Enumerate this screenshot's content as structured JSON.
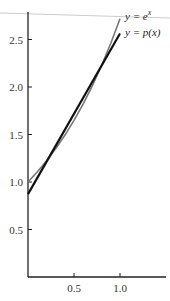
{
  "chart_data": {
    "type": "line",
    "title": "",
    "xlabel": "",
    "ylabel": "",
    "xlim": [
      0,
      1.55
    ],
    "ylim": [
      0,
      2.75
    ],
    "grid": false,
    "x_ticks": [
      0.5,
      1.0
    ],
    "x_tick_labels": [
      "0.5",
      "1.0"
    ],
    "y_ticks": [
      0.5,
      1.0,
      1.5,
      2.0,
      2.5
    ],
    "y_tick_labels": [
      "0.5",
      "1.0",
      "1.5",
      "2.0",
      "2.5"
    ],
    "series": [
      {
        "name": "y = e^x",
        "label": "y = e",
        "label_sup": "x",
        "color": "#777777",
        "x": [
          0,
          0.1,
          0.2,
          0.3,
          0.4,
          0.5,
          0.6,
          0.7,
          0.8,
          0.9,
          1.0
        ],
        "y": [
          1.0,
          1.105,
          1.221,
          1.35,
          1.492,
          1.649,
          1.822,
          2.014,
          2.226,
          2.46,
          2.718
        ]
      },
      {
        "name": "y = p(x)",
        "label": "y = p(x)",
        "color": "#111111",
        "x": [
          0,
          1.0
        ],
        "y": [
          0.873,
          2.563
        ]
      }
    ],
    "legend_position": "inline-right"
  }
}
